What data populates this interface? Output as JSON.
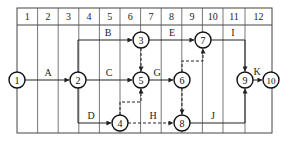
{
  "diagram": {
    "type": "time-scaled double-code network diagram",
    "grid": {
      "left": 17,
      "top": 8,
      "header_bottom": 25,
      "bottom": 133,
      "column_boundaries": [
        17,
        37.6,
        58.2,
        78.8,
        99.4,
        120,
        140.6,
        161.2,
        181.8,
        202.4,
        223,
        245,
        272
      ],
      "column_labels": [
        "1",
        "2",
        "3",
        "4",
        "5",
        "6",
        "7",
        "8",
        "9",
        "10",
        "11",
        "12"
      ]
    },
    "nodes": [
      {
        "id": "1",
        "label": "1",
        "x": 17,
        "y": 80
      },
      {
        "id": "2",
        "label": "2",
        "x": 78,
        "y": 80
      },
      {
        "id": "3",
        "label": "3",
        "x": 141,
        "y": 40
      },
      {
        "id": "4",
        "label": "4",
        "x": 120,
        "y": 123
      },
      {
        "id": "5",
        "label": "5",
        "x": 141,
        "y": 80
      },
      {
        "id": "6",
        "label": "6",
        "x": 182,
        "y": 80
      },
      {
        "id": "7",
        "label": "7",
        "x": 203,
        "y": 40
      },
      {
        "id": "8",
        "label": "8",
        "x": 182,
        "y": 123
      },
      {
        "id": "9",
        "label": "9",
        "x": 245,
        "y": 80
      },
      {
        "id": "10",
        "label": "10",
        "x": 271,
        "y": 80
      }
    ],
    "activities": [
      {
        "label": "A",
        "from": "1",
        "to": "2",
        "style": "solid",
        "label_x": 48,
        "label_y": 76
      },
      {
        "label": "B",
        "from": "2",
        "to": "3",
        "style": "solid",
        "label_x": 108,
        "label_y": 36
      },
      {
        "label": "C",
        "from": "2",
        "to": "5",
        "style": "solid",
        "label_x": 109,
        "label_y": 76
      },
      {
        "label": "D",
        "from": "2",
        "to": "4",
        "style": "solid",
        "label_x": 91,
        "label_y": 119
      },
      {
        "label": "E",
        "from": "3",
        "to": "7",
        "style": "solid",
        "label_x": 172,
        "label_y": 36
      },
      {
        "label": "G",
        "from": "5",
        "to": "6",
        "style": "solid",
        "label_x": 157,
        "label_y": 76
      },
      {
        "label": "H",
        "from": "4",
        "to": "8",
        "style": "dashed",
        "label_x": 153,
        "label_y": 119
      },
      {
        "label": "I",
        "from": "7",
        "to": "9",
        "style": "solid",
        "label_x": 233,
        "label_y": 36
      },
      {
        "label": "J",
        "from": "8",
        "to": "9",
        "style": "solid",
        "label_x": 213,
        "label_y": 119
      },
      {
        "label": "K",
        "from": "9",
        "to": "10",
        "style": "solid",
        "label_x": 257,
        "label_y": 75
      }
    ],
    "dummy_activities": [
      {
        "from": "3",
        "to": "5",
        "style": "dashed"
      },
      {
        "from": "4",
        "to": "5",
        "style": "dashed"
      },
      {
        "from": "6",
        "to": "7",
        "style": "dashed"
      },
      {
        "from": "6",
        "to": "8",
        "style": "dashed"
      }
    ]
  }
}
